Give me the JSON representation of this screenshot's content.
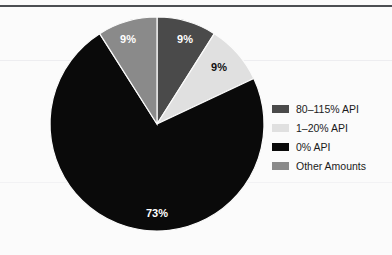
{
  "figure": {
    "background_color": "#fbfbfb",
    "rule_color": "#4c4f52"
  },
  "legend": {
    "items": [
      {
        "label": "80–115% API",
        "color": "#4a4a4a",
        "swatch_name": "legend-swatch-80-115-api"
      },
      {
        "label": "1–20% API",
        "color": "#e0e0e0",
        "swatch_name": "legend-swatch-1-20-api"
      },
      {
        "label": "0% API",
        "color": "#0a0a0a",
        "swatch_name": "legend-swatch-0-api"
      },
      {
        "label": "Other Amounts",
        "color": "#8a8a8a",
        "swatch_name": "legend-swatch-other-amounts"
      }
    ]
  },
  "chart_data": {
    "type": "pie",
    "title": "",
    "subtitle": "",
    "xlabel": "",
    "ylabel": "",
    "legend_position": "right",
    "grid": false,
    "start_angle_deg": 0,
    "direction": "clockwise",
    "categories": [
      "80–115% API",
      "1–20% API",
      "0% API",
      "Other Amounts"
    ],
    "values": [
      9,
      9,
      73,
      9
    ],
    "value_unit": "%",
    "colors": [
      "#4a4a4a",
      "#e0e0e0",
      "#0a0a0a",
      "#8a8a8a"
    ],
    "slices": [
      {
        "category": "80–115% API",
        "value": 9,
        "label": "9%",
        "color": "#4a4a4a",
        "label_color": "#ffffff",
        "label_x": 185,
        "label_y": 40
      },
      {
        "category": "1–20% API",
        "value": 9,
        "label": "9%",
        "color": "#e0e0e0",
        "label_color": "#111111",
        "label_x": 219,
        "label_y": 68
      },
      {
        "category": "0% API",
        "value": 73,
        "label": "73%",
        "color": "#0a0a0a",
        "label_color": "#ffffff",
        "label_x": 157,
        "label_y": 214
      },
      {
        "category": "Other Amounts",
        "value": 9,
        "label": "9%",
        "color": "#8a8a8a",
        "label_color": "#ffffff",
        "label_x": 128,
        "label_y": 40
      }
    ]
  }
}
